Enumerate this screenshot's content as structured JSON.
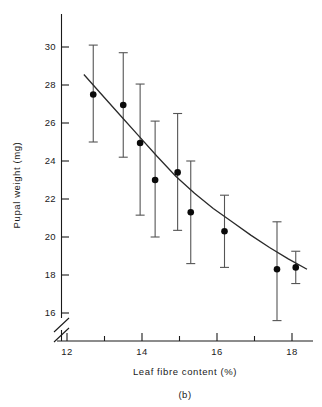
{
  "chart_data": {
    "type": "scatter",
    "title": "",
    "panel_label": "(b)",
    "xlabel": "Leaf  fibre content  (%)",
    "ylabel": "Pupal  weight  (mg)",
    "xlim": [
      11.5,
      18.6
    ],
    "ylim": [
      15.0,
      30.9
    ],
    "yaxis_break": true,
    "yaxis_break_note": "axis broken below 16",
    "grid": false,
    "legend": null,
    "x_ticks_major": [
      12,
      14,
      16,
      18
    ],
    "x_tick_labels": [
      "12",
      "14",
      "16",
      "18"
    ],
    "x_ticks_minor": [
      13,
      15,
      17
    ],
    "y_ticks_major": [
      16,
      18,
      20,
      22,
      24,
      26,
      28,
      30
    ],
    "y_tick_labels": [
      "16",
      "18",
      "20",
      "22",
      "24",
      "26",
      "28",
      "30"
    ],
    "x": [
      12.7,
      13.5,
      13.95,
      14.35,
      14.95,
      15.3,
      16.2,
      17.6,
      18.1
    ],
    "y": [
      27.5,
      26.95,
      24.95,
      23.0,
      23.4,
      21.3,
      20.3,
      18.3,
      18.4
    ],
    "err_low": [
      25.0,
      24.2,
      21.15,
      20.0,
      20.35,
      18.6,
      18.4,
      15.6,
      17.55
    ],
    "err_high": [
      30.1,
      29.7,
      28.05,
      26.1,
      26.5,
      24.0,
      22.2,
      20.8,
      19.25
    ],
    "fit_curve_x": [
      12.45,
      12.9,
      13.4,
      13.9,
      14.4,
      14.9,
      15.4,
      15.9,
      16.4,
      16.9,
      17.4,
      17.9,
      18.4
    ],
    "fit_curve_y": [
      28.55,
      27.55,
      26.45,
      25.35,
      24.25,
      23.2,
      22.3,
      21.5,
      20.8,
      20.1,
      19.45,
      18.85,
      18.3
    ],
    "marker": "filled-circle",
    "errorbar_style": "capped-vertical"
  },
  "figure": {
    "caption": "(b)"
  }
}
